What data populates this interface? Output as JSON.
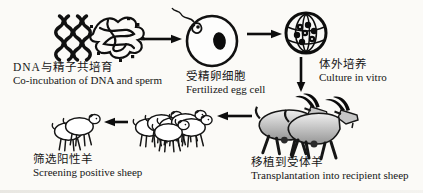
{
  "figure": {
    "type": "process-flow-diagram",
    "topic": "Sperm-mediated gene transfer in sheep",
    "colors": {
      "ink": "#161616",
      "paper": "#fbfaf7",
      "goat_gray": "#9a9a9a"
    },
    "steps": [
      {
        "id": "co-incubation",
        "zh": "DNA与精子共培育",
        "en": "Co-incubation of DNA and sperm"
      },
      {
        "id": "fertilized-egg",
        "zh": "受精卵细胞",
        "en": "Fertilized egg cell"
      },
      {
        "id": "culture-in-vitro",
        "zh": "体外培养",
        "en": "Culture in vitro"
      },
      {
        "id": "transplantation",
        "zh": "移植到受体羊",
        "en": "Transplantation into recipient sheep"
      },
      {
        "id": "screening",
        "zh": "筛选阳性羊",
        "en": "Screening positive sheep"
      }
    ]
  }
}
